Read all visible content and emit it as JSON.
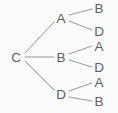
{
  "diagram": {
    "type": "tree",
    "background_color": "#fbfbfb",
    "stroke_color": "#8a8a8a",
    "text_color": "#5e5e5e",
    "root": {
      "id": "root",
      "label": "C",
      "x": 16,
      "y": 57
    },
    "level1": [
      {
        "id": "n-a",
        "label": "A",
        "x": 61,
        "y": 18
      },
      {
        "id": "n-b",
        "label": "B",
        "x": 61,
        "y": 57
      },
      {
        "id": "n-d",
        "label": "D",
        "x": 61,
        "y": 94
      }
    ],
    "level2": [
      {
        "id": "leaf-1",
        "label": "B",
        "x": 99,
        "y": 8,
        "parent": "n-a"
      },
      {
        "id": "leaf-2",
        "label": "D",
        "x": 99,
        "y": 31,
        "parent": "n-a"
      },
      {
        "id": "leaf-3",
        "label": "A",
        "x": 99,
        "y": 46,
        "parent": "n-b"
      },
      {
        "id": "leaf-4",
        "label": "D",
        "x": 99,
        "y": 67,
        "parent": "n-b"
      },
      {
        "id": "leaf-5",
        "label": "A",
        "x": 99,
        "y": 82,
        "parent": "n-d"
      },
      {
        "id": "leaf-6",
        "label": "B",
        "x": 99,
        "y": 101,
        "parent": "n-d"
      }
    ],
    "edges": [
      {
        "id": "edge-root-a",
        "from": "C",
        "to": "A",
        "x1": 25,
        "y1": 53,
        "x2": 54,
        "y2": 22
      },
      {
        "id": "edge-root-b",
        "from": "C",
        "to": "B",
        "x1": 25,
        "y1": 57,
        "x2": 54,
        "y2": 57
      },
      {
        "id": "edge-root-d",
        "from": "C",
        "to": "D",
        "x1": 25,
        "y1": 61,
        "x2": 54,
        "y2": 90
      },
      {
        "id": "edge-a-b",
        "from": "A",
        "to": "B",
        "x1": 69,
        "y1": 15,
        "x2": 92,
        "y2": 9
      },
      {
        "id": "edge-a-d",
        "from": "A",
        "to": "D",
        "x1": 69,
        "y1": 21,
        "x2": 92,
        "y2": 30
      },
      {
        "id": "edge-b-a",
        "from": "B",
        "to": "A",
        "x1": 69,
        "y1": 54,
        "x2": 92,
        "y2": 46
      },
      {
        "id": "edge-b-d",
        "from": "B",
        "to": "D",
        "x1": 69,
        "y1": 60,
        "x2": 92,
        "y2": 67
      },
      {
        "id": "edge-d-a",
        "from": "D",
        "to": "A",
        "x1": 69,
        "y1": 91,
        "x2": 92,
        "y2": 83
      },
      {
        "id": "edge-d-b",
        "from": "D",
        "to": "B",
        "x1": 69,
        "y1": 97,
        "x2": 92,
        "y2": 101
      }
    ]
  }
}
